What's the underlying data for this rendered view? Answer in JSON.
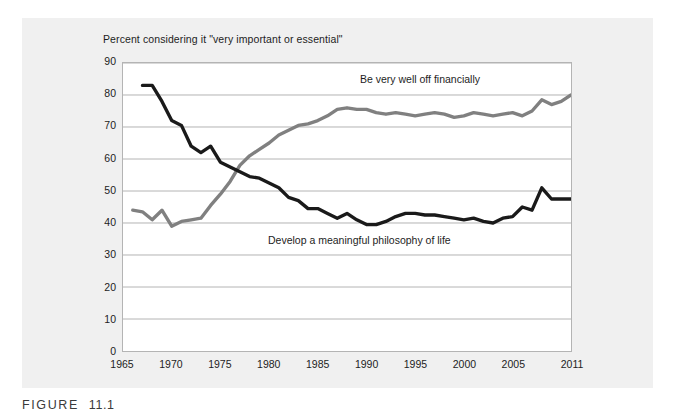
{
  "figure": {
    "caption_label": "FIGURE",
    "caption_number": "11.1"
  },
  "chart_data": {
    "type": "line",
    "title": "Percent considering it \"very important or essential\"",
    "xlabel": "",
    "ylabel": "",
    "xlim": [
      1965,
      2011
    ],
    "ylim": [
      0,
      90
    ],
    "grid": true,
    "legend_position": "inline-annotations",
    "y_ticks": [
      0,
      10,
      20,
      30,
      40,
      50,
      60,
      70,
      80,
      90
    ],
    "y_tick_labels": [
      "0",
      "10",
      "20",
      "30",
      "40",
      "50",
      "60",
      "70",
      "80",
      "90"
    ],
    "x_ticks": [
      1965,
      1970,
      1975,
      1980,
      1985,
      1990,
      1995,
      2000,
      2005,
      2011
    ],
    "x_tick_labels": [
      "1965",
      "1970",
      "1975",
      "1980",
      "1985",
      "1990",
      "1995",
      "2000",
      "2005",
      "2011"
    ],
    "series": [
      {
        "name": "Be very well off financially",
        "color": "#808080",
        "annotation": "Be very well off financially",
        "x": [
          1966,
          1967,
          1968,
          1969,
          1970,
          1971,
          1972,
          1973,
          1974,
          1975,
          1976,
          1977,
          1978,
          1979,
          1980,
          1981,
          1982,
          1983,
          1984,
          1985,
          1986,
          1987,
          1988,
          1989,
          1990,
          1991,
          1992,
          1993,
          1994,
          1995,
          1996,
          1997,
          1998,
          1999,
          2000,
          2001,
          2002,
          2003,
          2004,
          2005,
          2006,
          2007,
          2008,
          2009,
          2010,
          2011
        ],
        "values": [
          44,
          43.5,
          41,
          44,
          39,
          40.5,
          41,
          41.5,
          45.5,
          49,
          53,
          58,
          61,
          63,
          65,
          67.5,
          69,
          70.5,
          71,
          72,
          73.5,
          75.5,
          76,
          75.5,
          75.5,
          74.5,
          74,
          74.5,
          74,
          73.5,
          74,
          74.5,
          74,
          73,
          73.5,
          74.5,
          74,
          73.5,
          74,
          74.5,
          73.5,
          75,
          78.5,
          77,
          78,
          80
        ]
      },
      {
        "name": "Develop a meaningful philosophy of life",
        "color": "#1a1a1a",
        "annotation": "Develop a meaningful philosophy of life",
        "x": [
          1967,
          1968,
          1969,
          1970,
          1971,
          1972,
          1973,
          1974,
          1975,
          1976,
          1977,
          1978,
          1979,
          1980,
          1981,
          1982,
          1983,
          1984,
          1985,
          1986,
          1987,
          1988,
          1989,
          1990,
          1991,
          1992,
          1993,
          1994,
          1995,
          1996,
          1997,
          1998,
          1999,
          2000,
          2001,
          2002,
          2003,
          2004,
          2005,
          2006,
          2007,
          2008,
          2009,
          2010,
          2011
        ],
        "values": [
          83,
          83,
          78,
          72,
          70.5,
          64,
          62,
          64,
          59,
          57.5,
          56,
          54.5,
          54,
          52.5,
          51,
          48,
          47,
          44.5,
          44.5,
          43,
          41.5,
          43,
          41,
          39.5,
          39.5,
          40.5,
          42,
          43,
          43,
          42.5,
          42.5,
          42,
          41.5,
          41,
          41.5,
          40.5,
          40,
          41.5,
          42,
          45,
          44,
          51,
          47.5,
          47.5,
          47.5
        ]
      }
    ]
  }
}
